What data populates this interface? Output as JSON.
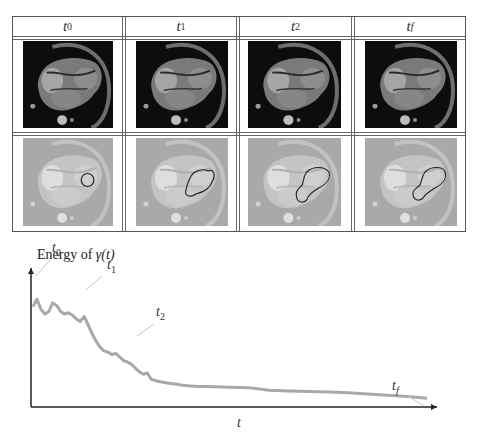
{
  "figure": {
    "columns": [
      {
        "label": "t",
        "sub": "0"
      },
      {
        "label": "t",
        "sub": "1"
      },
      {
        "label": "t",
        "sub": "2"
      },
      {
        "label": "t",
        "sub": "f"
      }
    ],
    "rows": [
      {
        "name": "mri-frames",
        "description": "cardiac MRI four-chamber view"
      },
      {
        "name": "segmentation-overlays",
        "description": "faded MRI with evolving contour overlay"
      }
    ],
    "contours": [
      "circle",
      "irregular-blob",
      "elongated-blob",
      "elongated-blob"
    ]
  },
  "chart_data": {
    "type": "line",
    "title": "",
    "ylabel_prefix": "Energy of ",
    "ylabel_symbol": "γ(t)",
    "xlabel": "t",
    "grid": false,
    "axis_ticks": false,
    "series": [
      {
        "name": "energy",
        "color": "#a8a8a8",
        "x": [
          0,
          0.01,
          0.02,
          0.03,
          0.04,
          0.05,
          0.06,
          0.07,
          0.08,
          0.09,
          0.1,
          0.11,
          0.12,
          0.13,
          0.14,
          0.15,
          0.16,
          0.17,
          0.18,
          0.19,
          0.2,
          0.21,
          0.22,
          0.23,
          0.24,
          0.25,
          0.26,
          0.27,
          0.28,
          0.29,
          0.3,
          0.32,
          0.34,
          0.36,
          0.38,
          0.4,
          0.42,
          0.44,
          0.46,
          0.48,
          0.5,
          0.55,
          0.6,
          0.65,
          0.7,
          0.75,
          0.8,
          0.85,
          0.9,
          0.95,
          1.0
        ],
        "y": [
          0.8,
          0.86,
          0.78,
          0.74,
          0.76,
          0.83,
          0.81,
          0.76,
          0.74,
          0.75,
          0.73,
          0.7,
          0.68,
          0.72,
          0.65,
          0.58,
          0.52,
          0.47,
          0.44,
          0.43,
          0.41,
          0.42,
          0.39,
          0.36,
          0.35,
          0.33,
          0.3,
          0.27,
          0.25,
          0.26,
          0.21,
          0.19,
          0.18,
          0.17,
          0.16,
          0.155,
          0.15,
          0.15,
          0.148,
          0.146,
          0.145,
          0.14,
          0.12,
          0.115,
          0.11,
          0.105,
          0.1,
          0.09,
          0.08,
          0.07,
          0.055
        ]
      }
    ],
    "annotations": [
      {
        "label": "t",
        "sub": "0",
        "x": 0.02
      },
      {
        "label": "t",
        "sub": "1",
        "x": 0.19
      },
      {
        "label": "t",
        "sub": "2",
        "x": 0.3
      },
      {
        "label": "t",
        "sub": "f",
        "x": 1.0
      }
    ],
    "ylim": [
      0,
      1
    ],
    "xlim": [
      0,
      1
    ]
  }
}
